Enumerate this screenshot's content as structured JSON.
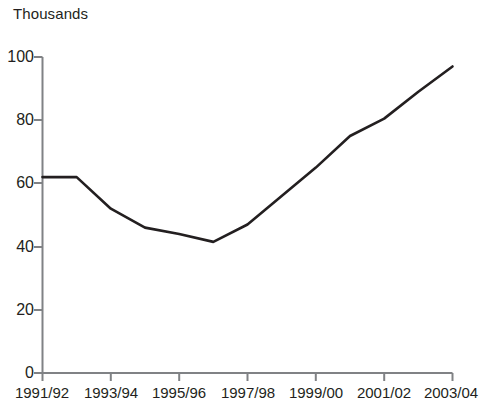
{
  "chart_data": {
    "type": "line",
    "title": "Thousands",
    "subtitle": "",
    "xlabel": "",
    "ylabel": "Thousands",
    "grid": false,
    "legend": null,
    "legend_position": "none",
    "line_color": "#231f20",
    "axis_color": "#808285",
    "xlim": [
      1991,
      2003
    ],
    "ylim": [
      0,
      100
    ],
    "ytick_labels": [
      "0",
      "20",
      "40",
      "60",
      "80",
      "100"
    ],
    "ytick_values": [
      0,
      20,
      40,
      60,
      80,
      100
    ],
    "xtick_labels": [
      "1991/92",
      "1993/94",
      "1995/96",
      "1997/98",
      "1999/00",
      "2001/02",
      "2003/04"
    ],
    "xtick_values": [
      1991,
      1993,
      1995,
      1997,
      1999,
      2001,
      2003
    ],
    "categories": [
      "1991/92",
      "1992/93",
      "1993/94",
      "1994/95",
      "1995/96",
      "1996/97",
      "1997/98",
      "1998/99",
      "1999/00",
      "2000/01",
      "2001/02",
      "2002/03",
      "2003/04"
    ],
    "x": [
      1991,
      1992,
      1993,
      1994,
      1995,
      1996,
      1997,
      1998,
      1999,
      2000,
      2001,
      2002,
      2003
    ],
    "values": [
      62,
      62,
      52,
      46,
      44,
      41.5,
      47,
      56,
      65,
      75,
      80.5,
      89,
      97
    ]
  }
}
